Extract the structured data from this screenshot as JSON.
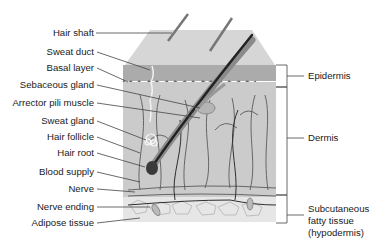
{
  "diagram": {
    "type": "anatomical-cross-section",
    "left_labels": [
      {
        "id": "hair-shaft",
        "text": "Hair shaft",
        "y": 33
      },
      {
        "id": "sweat-duct",
        "text": "Sweat duct",
        "y": 52
      },
      {
        "id": "basal-layer",
        "text": "Basal layer",
        "y": 68
      },
      {
        "id": "sebaceous-gland",
        "text": "Sebaceous gland",
        "y": 85
      },
      {
        "id": "arrector-pili-muscle",
        "text": "Arrector pili muscle",
        "y": 103
      },
      {
        "id": "sweat-gland",
        "text": "Sweat gland",
        "y": 121
      },
      {
        "id": "hair-follicle",
        "text": "Hair follicle",
        "y": 137
      },
      {
        "id": "hair-root",
        "text": "Hair root",
        "y": 153
      },
      {
        "id": "blood-supply",
        "text": "Blood supply",
        "y": 172
      },
      {
        "id": "nerve",
        "text": "Nerve",
        "y": 189
      },
      {
        "id": "nerve-ending",
        "text": "Nerve ending",
        "y": 207
      },
      {
        "id": "adipose-tissue",
        "text": "Adipose tissue",
        "y": 223
      }
    ],
    "right_labels": [
      {
        "id": "epidermis",
        "text": "Epidermis"
      },
      {
        "id": "dermis",
        "text": "Dermis"
      },
      {
        "id": "subcutaneous",
        "lines": [
          "Subcutaneous",
          "fatty tissue",
          "(hypodermis)"
        ]
      }
    ],
    "colors": {
      "skin_surface": "#d4d4d4",
      "epidermis_band": "#a9a9a9",
      "dermis": "#c8c8c8",
      "hair": "#2b2b2b",
      "leader_line": "#444444",
      "vessels": "#555555"
    }
  }
}
